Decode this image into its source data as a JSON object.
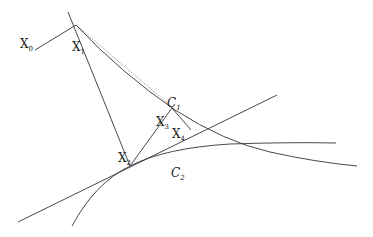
{
  "diagram": {
    "type": "geometric projection iteration",
    "labels": {
      "x0": {
        "main": "X",
        "sub": "0"
      },
      "x1": {
        "main": "X",
        "sub": "1"
      },
      "x2": {
        "main": "X",
        "sub": "2"
      },
      "x3": {
        "main": "X",
        "sub": "3"
      },
      "x4": {
        "main": "X",
        "sub": "4"
      },
      "c1": {
        "main": "C",
        "sub": "1"
      },
      "c2": {
        "main": "C",
        "sub": "2"
      }
    },
    "colors": {
      "stroke": "#333333",
      "background": "#ffffff",
      "dotted": "#888888"
    }
  }
}
